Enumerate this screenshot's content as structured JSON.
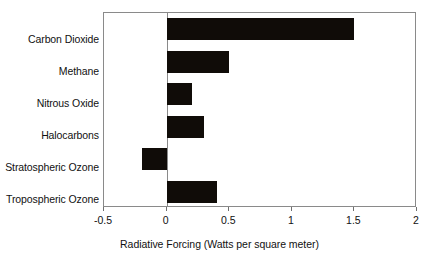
{
  "chart_data": {
    "type": "bar",
    "orientation": "horizontal",
    "title": "",
    "subtitle": "",
    "xlabel": "Radiative Forcing (Watts per square meter)",
    "ylabel": "",
    "categories": [
      "Carbon Dioxide",
      "Methane",
      "Nitrous Oxide",
      "Halocarbons",
      "Stratospheric Ozone",
      "Tropospheric Ozone"
    ],
    "values": [
      1.5,
      0.5,
      0.2,
      0.3,
      -0.2,
      0.4
    ],
    "xlim": [
      -0.5,
      2
    ],
    "xticks": [
      -0.5,
      0,
      0.5,
      1,
      1.5,
      2
    ],
    "xtick_labels": [
      "-0.5",
      "0",
      "0.5",
      "1",
      "1.5",
      "2"
    ],
    "grid": false,
    "legend": null,
    "bar_color": "#100c08",
    "frame_color": "#8a8a8a",
    "zero_reference": 0
  },
  "axis": {
    "title": "Radiative Forcing (Watts per square meter)"
  }
}
